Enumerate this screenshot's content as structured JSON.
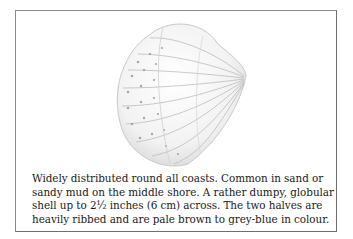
{
  "figure": {
    "illustration": "cockle-shell-drawing",
    "caption_lines": [
      "Widely distributed round all coasts. Common in sand or",
      "sandy mud on the middle shore. A rather dumpy, globular",
      "shell up to 2½ inches (6 cm) across. The two halves are",
      "heavily ribbed and are pale brown to grey-blue in colour."
    ]
  }
}
